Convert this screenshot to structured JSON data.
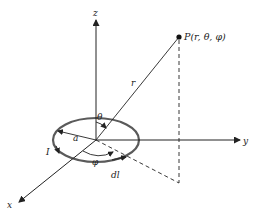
{
  "diagram": {
    "axes": {
      "x_label": "x",
      "y_label": "y",
      "z_label": "z"
    },
    "point": {
      "label": "P(r, θ, φ)"
    },
    "labels": {
      "r": "r",
      "theta": "θ",
      "phi": "φ",
      "radius": "a",
      "current": "I",
      "element": "dl"
    },
    "colors": {
      "loop": "#555555",
      "line": "#222222",
      "background": "#ffffff"
    }
  }
}
